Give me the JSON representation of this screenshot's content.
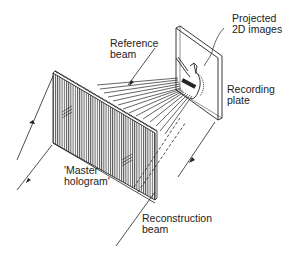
{
  "diagram": {
    "type": "optical-setup",
    "colors": {
      "line": "#222222",
      "background": "#ffffff",
      "hatch": "#555555"
    },
    "labels": {
      "projected_images": "Projected\n2D images",
      "reference_beam": "Reference\nbeam",
      "recording_plate": "Recording\nplate",
      "master_hologram": "'Master\nhologram'",
      "reconstruction_beam": "Reconstruction\nbeam"
    },
    "components": [
      {
        "id": "master-hologram",
        "label": "'Master hologram'",
        "kind": "plate"
      },
      {
        "id": "recording-plate",
        "label": "Recording plate",
        "kind": "plate"
      },
      {
        "id": "reference-beam",
        "label": "Reference beam",
        "kind": "beam"
      },
      {
        "id": "reconstruction-beam",
        "label": "Reconstruction beam",
        "kind": "beam"
      },
      {
        "id": "projected-images",
        "label": "Projected 2D images",
        "kind": "image"
      }
    ]
  }
}
